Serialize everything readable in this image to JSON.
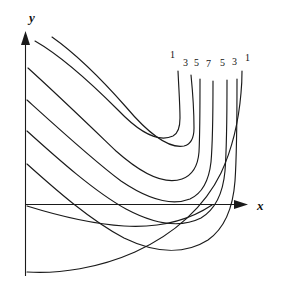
{
  "figure": {
    "kind": "contour-plot",
    "background_color": "#ffffff",
    "stroke_color": "#1a1a1a",
    "axes": {
      "x_label": "x",
      "y_label": "y",
      "x_axis": {
        "x1": 25,
        "y1": 204,
        "x2": 243,
        "y2": 204,
        "arrow": "right"
      },
      "y_axis": {
        "x1": 25.5,
        "y1": 276,
        "x2": 25.5,
        "y2": 34,
        "arrow": "up"
      },
      "x_label_pos": {
        "x": 259,
        "y": 209
      },
      "y_label_pos": {
        "x": 27,
        "y": 22
      },
      "show_ticks": false,
      "show_grid": false
    }
  },
  "chart_data": {
    "type": "line",
    "title": "",
    "xlabel": "x",
    "ylabel": "y",
    "grid": false,
    "legend": "inline-end-labels",
    "xlim": [
      25,
      250
    ],
    "ylim": [
      285,
      30
    ],
    "levels": [
      1,
      3,
      5,
      7,
      5,
      3,
      1
    ],
    "series": [
      {
        "name": "1",
        "label": "1",
        "label_pos": {
          "x": 170,
          "y": 58
        },
        "path": "M 35 41 C 63 57 94 86 118 110 C 140 133 158 143 173 136 C 179 133 180 126 180 118 C 180 106 179 92 178 71"
      },
      {
        "name": "3",
        "label": "3",
        "label_pos": {
          "x": 183,
          "y": 66
        },
        "path": "M 52 37 C 79 56 104 82 126 107 C 148 133 168 149 184 146 C 192 144 194 137 194 128 C 194 113 193 95 191 75"
      },
      {
        "name": "5",
        "label": "5",
        "label_pos": {
          "x": 194,
          "y": 66
        },
        "path": "M 28 68 C 60 97 92 128 116 151 C 143 175 165 185 182 179 C 193 175 198 165 199 152 C 200 133 200 110 200 79"
      },
      {
        "name": "7",
        "label": "7",
        "label_pos": {
          "x": 206,
          "y": 67
        },
        "path": "M 27 100 C 59 129 94 161 121 181 C 149 200 172 206 190 199 C 203 193 209 180 211 162 C 213 139 213 113 213 81"
      },
      {
        "name": "5b",
        "label": "5",
        "label_pos": {
          "x": 220,
          "y": 66
        },
        "path": "M 27 131 C 58 159 95 192 126 209 C 156 225 181 228 201 218 C 216 209 223 193 225 171 C 227 145 227 116 227 80"
      },
      {
        "name": "3b",
        "label": "3",
        "label_pos": {
          "x": 232,
          "y": 65
        },
        "path": "M 27 164 C 56 190 90 220 124 238 C 157 254 186 254 208 240 C 225 228 233 208 235 181 C 237 152 237 116 237 79"
      },
      {
        "name": "1b",
        "label": "1",
        "label_pos": {
          "x": 245,
          "y": 61
        },
        "path": "M 27 272 C 60 274 99 268 135 252 C 175 234 205 206 221 173 C 234 145 239 117 241 93 C 242 83 242 78 242 71"
      }
    ],
    "extra_curve": {
      "name": "near-axis-curve",
      "path": "M 27 206 C 56 215 92 224 124 226 C 158 228 188 221 212 205"
    }
  }
}
